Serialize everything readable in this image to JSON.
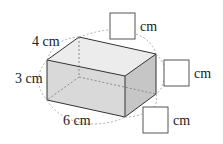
{
  "figure": {
    "type": "rectangular prism diagram",
    "dimensions": {
      "depth_label": "4 cm",
      "height_label": "3 cm",
      "width_label": "6 cm"
    },
    "answer_boxes": [
      {
        "unit": "cm",
        "value": ""
      },
      {
        "unit": "cm",
        "value": ""
      },
      {
        "unit": "cm",
        "value": ""
      }
    ],
    "colors": {
      "edge": "#333333",
      "hidden_edge": "#666666",
      "dashed_arc": "#999999",
      "top_face": "#eeeeee",
      "front_face": "#dcdcdc",
      "side_face": "#c8c8c8",
      "box_border": "#555555"
    }
  }
}
